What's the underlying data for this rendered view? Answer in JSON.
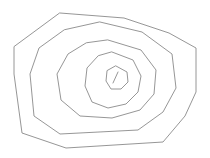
{
  "figure": {
    "background_color": "#ffffff",
    "stroke_color": "#8a8a8a",
    "stroke_width": 0.9,
    "width": 210,
    "height": 158,
    "shape_count": 5
  },
  "chart_data": {
    "type": "line",
    "xlabel": "",
    "ylabel": "",
    "xlim": [
      0,
      210
    ],
    "ylim": [
      0,
      158
    ],
    "grid": false,
    "legend": "none",
    "series": [
      {
        "name": "ring-1-outer",
        "closed": true,
        "points": [
          [
            60,
            13
          ],
          [
            124,
            18
          ],
          [
            169,
            33
          ],
          [
            196,
            48
          ],
          [
            196,
            92
          ],
          [
            185,
            116
          ],
          [
            163,
            142
          ],
          [
            66,
            148
          ],
          [
            22,
            133
          ],
          [
            14,
            74
          ],
          [
            14,
            47
          ]
        ]
      },
      {
        "name": "ring-2",
        "closed": true,
        "points": [
          [
            100,
            22
          ],
          [
            142,
            32
          ],
          [
            172,
            54
          ],
          [
            176,
            88
          ],
          [
            163,
            112
          ],
          [
            138,
            130
          ],
          [
            60,
            134
          ],
          [
            34,
            116
          ],
          [
            30,
            74
          ],
          [
            39,
            48
          ],
          [
            64,
            30
          ]
        ]
      },
      {
        "name": "ring-3",
        "closed": true,
        "points": [
          [
            108,
            40
          ],
          [
            141,
            50
          ],
          [
            156,
            70
          ],
          [
            154,
            94
          ],
          [
            140,
            110
          ],
          [
            112,
            118
          ],
          [
            80,
            116
          ],
          [
            61,
            100
          ],
          [
            57,
            74
          ],
          [
            68,
            54
          ],
          [
            86,
            43
          ]
        ]
      },
      {
        "name": "ring-4",
        "closed": true,
        "points": [
          [
            112,
            52
          ],
          [
            133,
            60
          ],
          [
            141,
            76
          ],
          [
            138,
            92
          ],
          [
            126,
            104
          ],
          [
            108,
            108
          ],
          [
            92,
            102
          ],
          [
            85,
            86
          ],
          [
            87,
            68
          ],
          [
            98,
            56
          ]
        ]
      },
      {
        "name": "ring-5-inner",
        "closed": true,
        "points": [
          [
            116,
            66
          ],
          [
            127,
            72
          ],
          [
            128,
            82
          ],
          [
            121,
            89
          ],
          [
            111,
            89
          ],
          [
            106,
            81
          ],
          [
            107,
            71
          ]
        ]
      },
      {
        "name": "center-tick",
        "closed": false,
        "points": [
          [
            118,
            72
          ],
          [
            113,
            83
          ]
        ]
      }
    ]
  }
}
